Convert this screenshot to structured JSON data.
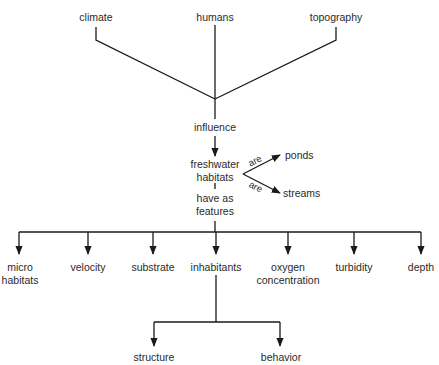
{
  "diagram": {
    "type": "concept-map",
    "colors": {
      "line": "#1a1a1a",
      "text": "#2a2a2a",
      "background": "#ffffff"
    },
    "sources": [
      {
        "id": "climate",
        "label": "climate"
      },
      {
        "id": "humans",
        "label": "humans"
      },
      {
        "id": "topography",
        "label": "topography"
      }
    ],
    "link_influence": "influence",
    "central": {
      "line1": "freshwater",
      "line2": "habitats"
    },
    "types_relation": "are",
    "types": [
      {
        "id": "ponds",
        "label": "ponds",
        "relation": "are"
      },
      {
        "id": "streams",
        "label": "streams",
        "relation": "are"
      }
    ],
    "link_features": {
      "line1": "have as",
      "line2": "features"
    },
    "features": [
      {
        "id": "micro-habitats",
        "line1": "micro",
        "line2": "habitats"
      },
      {
        "id": "velocity",
        "line1": "velocity",
        "line2": ""
      },
      {
        "id": "substrate",
        "line1": "substrate",
        "line2": ""
      },
      {
        "id": "inhabitants",
        "line1": "inhabitants",
        "line2": ""
      },
      {
        "id": "oxygen-concentration",
        "line1": "oxygen",
        "line2": "concentration"
      },
      {
        "id": "turbidity",
        "line1": "turbidity",
        "line2": ""
      },
      {
        "id": "depth",
        "line1": "depth",
        "line2": ""
      }
    ],
    "inhabitant_aspects": [
      {
        "id": "structure",
        "label": "structure"
      },
      {
        "id": "behavior",
        "label": "behavior"
      }
    ]
  }
}
